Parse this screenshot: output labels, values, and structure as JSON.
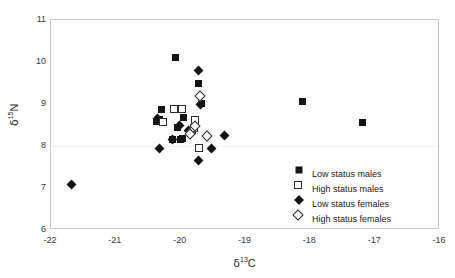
{
  "chart_data": {
    "type": "scatter",
    "title": "",
    "xlabel": "δ 13C",
    "ylabel": "δ 15N",
    "xlabel_parts": {
      "symbol": "δ",
      "superscript": "13",
      "element": "C"
    },
    "ylabel_parts": {
      "symbol": "δ",
      "superscript": "15",
      "element": "N"
    },
    "xlim": [
      -22,
      -16
    ],
    "ylim": [
      6,
      11
    ],
    "xticks": [
      "-22",
      "-21",
      "-20",
      "-19",
      "-18",
      "-17",
      "-16"
    ],
    "xtick_values": [
      -22,
      -21,
      -20,
      -19,
      -18,
      -17,
      -16
    ],
    "yticks": [
      "6",
      "7",
      "8",
      "9",
      "10",
      "11"
    ],
    "ytick_values": [
      6,
      7,
      8,
      9,
      10,
      11
    ],
    "grid": "horizontal-faint-at-8",
    "legend_position": "bottom-right-inside",
    "series": [
      {
        "name": "Low status males",
        "marker": "filled-square",
        "color": "#141414",
        "points": [
          [
            -20.08,
            10.1
          ],
          [
            -19.72,
            9.5
          ],
          [
            -19.68,
            9.02
          ],
          [
            -20.3,
            8.88
          ],
          [
            -19.95,
            8.68
          ],
          [
            -20.33,
            8.62
          ],
          [
            -20.38,
            8.58
          ],
          [
            -20.05,
            8.45
          ],
          [
            -19.82,
            8.38
          ],
          [
            -20.12,
            8.15
          ],
          [
            -20.0,
            8.15
          ],
          [
            -19.97,
            8.18
          ],
          [
            -18.12,
            9.05
          ],
          [
            -17.2,
            8.55
          ]
        ]
      },
      {
        "name": "High status males",
        "marker": "open-square",
        "color": "#ffffff",
        "points": [
          [
            -20.1,
            8.88
          ],
          [
            -19.98,
            8.88
          ],
          [
            -20.28,
            8.58
          ],
          [
            -19.78,
            8.62
          ],
          [
            -19.8,
            8.42
          ],
          [
            -19.72,
            7.95
          ]
        ]
      },
      {
        "name": "Low status females",
        "marker": "filled-diamond",
        "color": "#141414",
        "points": [
          [
            -21.68,
            7.08
          ],
          [
            -19.73,
            9.8
          ],
          [
            -19.7,
            9.0
          ],
          [
            -20.35,
            8.65
          ],
          [
            -20.02,
            8.48
          ],
          [
            -19.88,
            8.38
          ],
          [
            -20.12,
            8.15
          ],
          [
            -19.32,
            8.25
          ],
          [
            -20.33,
            7.95
          ],
          [
            -19.52,
            7.95
          ],
          [
            -19.72,
            7.65
          ]
        ]
      },
      {
        "name": "High status females",
        "marker": "open-diamond",
        "color": "#ffffff",
        "points": [
          [
            -19.7,
            9.2
          ],
          [
            -19.78,
            8.48
          ],
          [
            -19.85,
            8.28
          ],
          [
            -19.6,
            8.25
          ]
        ]
      }
    ]
  },
  "legend": {
    "items": [
      {
        "label": "Low status males",
        "marker": "filled-square"
      },
      {
        "label": "High status males",
        "marker": "open-square"
      },
      {
        "label": "Low status females",
        "marker": "filled-diamond"
      },
      {
        "label": "High status females",
        "marker": "open-diamond"
      }
    ]
  }
}
